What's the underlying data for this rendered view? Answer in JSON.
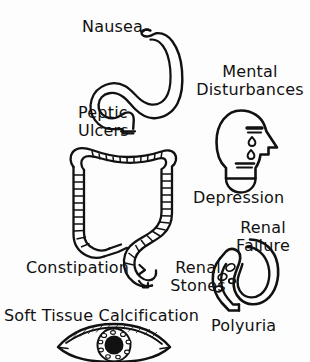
{
  "illustration": {
    "title": "Hypercalcemia / Hyperparathyroidism Symptoms Diagram",
    "background_color": "#fdfdfd",
    "ink_color": "#111111",
    "width": 310,
    "height": 362
  },
  "labels": {
    "nausea": "Nausea",
    "peptic_ulcers_line1": "Peptic",
    "peptic_ulcers_line2": "Ulcers",
    "mental_line1": "Mental",
    "mental_line2": "Disturbances",
    "depression": "Depression",
    "renal_failure_line1": "Renal",
    "renal_failure_line2": "Failure",
    "renal_stones_line1": "Renal",
    "renal_stones_line2": "Stones",
    "constipation": "Constipation",
    "polyuria": "Polyuria",
    "soft_tissue_calcification": "Soft Tissue Calcification"
  },
  "organs": [
    {
      "name": "stomach",
      "label": "Nausea / Peptic Ulcers"
    },
    {
      "name": "head-profile",
      "label": "Mental Disturbances / Depression"
    },
    {
      "name": "large-intestine",
      "label": "Constipation"
    },
    {
      "name": "kidney",
      "label": "Renal Failure / Renal Stones / Polyuria"
    },
    {
      "name": "eye",
      "label": "Soft Tissue Calcification"
    }
  ]
}
